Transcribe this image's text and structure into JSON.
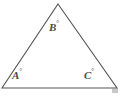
{
  "figure": {
    "type": "geometry-diagram",
    "shape": "triangle",
    "background_color": "#ffffff",
    "stroke_color": "#555555",
    "stroke_width": 1,
    "label_color": "#4a4a4a",
    "vertices": {
      "apex": {
        "x": 58,
        "y": 4
      },
      "bottom_left": {
        "x": 2,
        "y": 88
      },
      "bottom_right": {
        "x": 117,
        "y": 88
      }
    },
    "labels": [
      {
        "id": "A",
        "text": "A",
        "degree": "°",
        "position": "bottom-left-interior"
      },
      {
        "id": "B",
        "text": "B",
        "degree": "°",
        "position": "apex-interior"
      },
      {
        "id": "C",
        "text": "C",
        "degree": "°",
        "position": "bottom-right-interior"
      }
    ]
  }
}
